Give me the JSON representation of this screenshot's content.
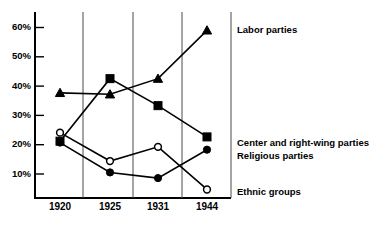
{
  "chart_data": {
    "type": "line",
    "title": "",
    "subtitle": "",
    "xlabel": "",
    "ylabel": "",
    "categories": [
      "1920",
      "1925",
      "1931",
      "1944"
    ],
    "x_tick_labels": [
      "1920",
      "1925",
      "1931",
      "1944"
    ],
    "y_tick_labels": [
      "10%",
      "20%",
      "30%",
      "40%",
      "50%",
      "60%"
    ],
    "y_tick_values": [
      10,
      20,
      30,
      40,
      50,
      60
    ],
    "ylim": [
      0,
      64
    ],
    "grid": false,
    "legend_position": "right",
    "series": [
      {
        "name": "Labor parties",
        "marker": "filled-triangle",
        "values": [
          37,
          36.5,
          42,
          59
        ],
        "legend_label": "Labor parties"
      },
      {
        "name": "Center and right-wing parties",
        "marker": "filled-square",
        "values": [
          20,
          42,
          32.5,
          21.5
        ],
        "legend_label": "Center and right-wing parties"
      },
      {
        "name": "Religious parties",
        "marker": "filled-circle",
        "values": [
          19.5,
          9,
          7,
          17
        ],
        "legend_label": "Religious parties"
      },
      {
        "name": "Ethnic groups",
        "marker": "open-circle",
        "values": [
          23,
          13,
          18,
          3
        ],
        "legend_label": "Ethnic groups"
      }
    ],
    "annotations": []
  },
  "legend": {
    "items": [
      {
        "label": "Labor parties"
      },
      {
        "label": "Center and right-wing parties"
      },
      {
        "label": "Religious parties"
      },
      {
        "label": "Ethnic groups"
      }
    ]
  },
  "axes": {
    "y_labels": [
      "60%",
      "50%",
      "40%",
      "30%",
      "20%",
      "10%"
    ],
    "x_labels": [
      "1920",
      "1925",
      "1931",
      "1944"
    ]
  },
  "colors": {
    "ink": "#000000",
    "separator": "#4a4a4a",
    "background": "#ffffff",
    "marker_fill_open": "#ffffff"
  }
}
